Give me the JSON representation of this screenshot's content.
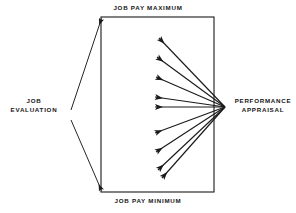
{
  "diagram": {
    "type": "flow-diagram",
    "background_color": "#ffffff",
    "line_color": "#1a1a1a",
    "labels": {
      "top": "JOB PAY MAXIMUM",
      "bottom": "JOB PAY MINIMUM",
      "left_line1": "JOB",
      "left_line2": "EVALUATION",
      "right_line1": "PERFORMANCE",
      "right_line2": "APPRAISAL"
    },
    "box": {
      "name": "pay-range-box",
      "x": 101,
      "y": 17,
      "width": 113,
      "height": 175
    },
    "evaluation_connectors": [
      {
        "name": "upper",
        "x1": 71,
        "y1": 110,
        "x2": 101,
        "y2": 19
      },
      {
        "name": "lower",
        "x1": 71,
        "y1": 120,
        "x2": 101,
        "y2": 190
      }
    ],
    "appraisal_origin": {
      "x": 225,
      "y": 107
    },
    "appraisal_arrows": [
      {
        "name": "arrow-1",
        "tip_x": 159,
        "tip_y": 38
      },
      {
        "name": "arrow-2",
        "tip_x": 157,
        "tip_y": 57
      },
      {
        "name": "arrow-3",
        "tip_x": 156,
        "tip_y": 77
      },
      {
        "name": "arrow-4",
        "tip_x": 155,
        "tip_y": 97
      },
      {
        "name": "arrow-5",
        "tip_x": 155,
        "tip_y": 107
      },
      {
        "name": "arrow-6",
        "tip_x": 155,
        "tip_y": 133
      },
      {
        "name": "arrow-7",
        "tip_x": 156,
        "tip_y": 152
      },
      {
        "name": "arrow-8",
        "tip_x": 158,
        "tip_y": 170
      },
      {
        "name": "arrow-9",
        "tip_x": 162,
        "tip_y": 178
      }
    ]
  }
}
